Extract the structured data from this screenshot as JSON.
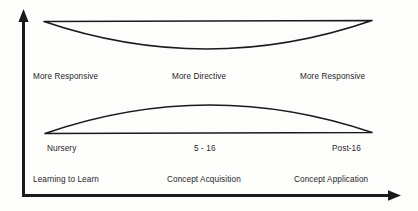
{
  "figure": {
    "name": "responsive-directive-learning-continuum",
    "background_color": "#fdfdfc",
    "stroke_color": "#1a1a1a",
    "text_color": "#262626"
  },
  "axes": {
    "y_axis": {
      "name": "vertical-axis",
      "label": ""
    },
    "x_axis": {
      "name": "horizontal-axis",
      "label": ""
    }
  },
  "shapes": {
    "upper_lens": {
      "name": "upper-crescent",
      "description": "concave crescent",
      "left_x": 44,
      "right_x": 372,
      "flat_y": 21,
      "bulge_y": 57
    },
    "lower_lens": {
      "name": "lower-convex-lens",
      "description": "convex lens",
      "left_x": 45,
      "right_x": 372,
      "flat_y": 133,
      "bulge_y": 97
    }
  },
  "rows": {
    "teaching_style": {
      "name": "teaching-style-row",
      "left": "More Responsive",
      "middle": "More Directive",
      "right": "More Responsive"
    },
    "stage": {
      "name": "education-stage-row",
      "left": "Nursery",
      "middle": "5 - 16",
      "right": "Post-16"
    },
    "concept": {
      "name": "learning-focus-row",
      "left": "Learning to Learn",
      "middle": "Concept Acquisition",
      "right": "Concept Application"
    }
  }
}
